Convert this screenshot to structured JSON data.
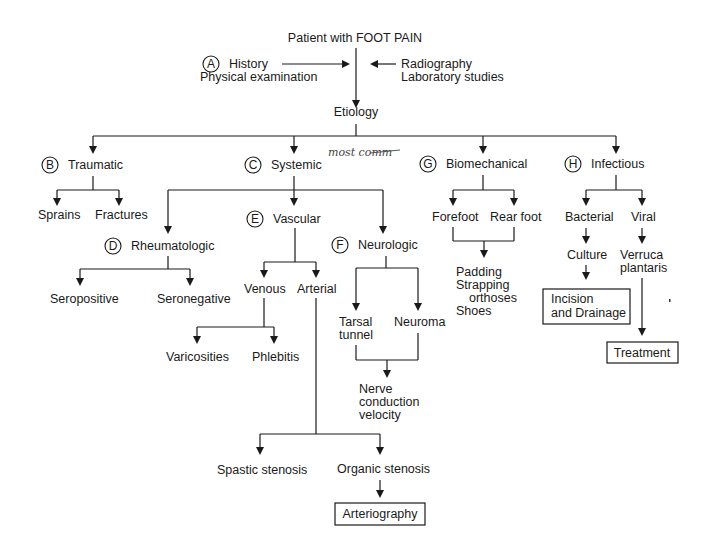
{
  "title": "Patient with FOOT PAIN",
  "inputs_left": {
    "badge": "A",
    "lines": [
      "History",
      "Physical examination"
    ]
  },
  "inputs_right": {
    "lines": [
      "Radiography",
      "Laboratory studies"
    ]
  },
  "etiology": "Etiology",
  "annotation": "most comm",
  "categories": {
    "traumatic": {
      "badge": "B",
      "label": "Traumatic",
      "children": [
        "Sprains",
        "Fractures"
      ]
    },
    "systemic": {
      "badge": "C",
      "label": "Systemic"
    },
    "rheumatologic": {
      "badge": "D",
      "label": "Rheumatologic",
      "children": [
        "Seropositive",
        "Seronegative"
      ]
    },
    "vascular": {
      "badge": "E",
      "label": "Vascular",
      "venous": {
        "label": "Venous",
        "children": [
          "Varicosities",
          "Phlebitis"
        ]
      },
      "arterial": {
        "label": "Arterial",
        "children": [
          "Spastic stenosis",
          "Organic stenosis"
        ],
        "test": "Arteriography"
      }
    },
    "neurologic": {
      "badge": "F",
      "label": "Neurologic",
      "children": [
        {
          "lines": [
            "Tarsal",
            "tunnel"
          ]
        },
        {
          "lines": [
            "Neuroma"
          ]
        }
      ],
      "test_lines": [
        "Nerve",
        "conduction",
        "velocity"
      ]
    },
    "biomechanical": {
      "badge": "G",
      "label": "Biomechanical",
      "children": [
        "Forefoot",
        "Rear foot"
      ],
      "treatment_lines": [
        "Padding",
        "Strapping",
        "orthoses",
        "Shoes"
      ]
    },
    "infectious": {
      "badge": "H",
      "label": "Infectious",
      "bacterial": {
        "label": "Bacterial",
        "step": "Culture",
        "box_lines": [
          "Incision",
          "and Drainage"
        ]
      },
      "viral": {
        "label": "Viral",
        "step_lines": [
          "Verruca",
          "plantaris"
        ],
        "box": "Treatment"
      }
    }
  },
  "colors": {
    "ink": "#1a1a1a",
    "background": "#ffffff",
    "handwriting": "#444444"
  }
}
